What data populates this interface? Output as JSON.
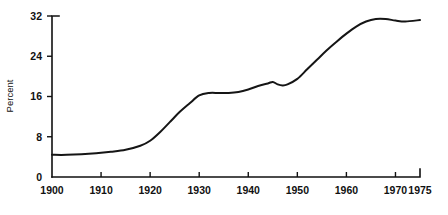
{
  "chart_data": {
    "type": "line",
    "title": "",
    "subtitle": "",
    "xlabel": "",
    "ylabel": "Percent",
    "xlim": [
      1900,
      1975
    ],
    "ylim": [
      0,
      32
    ],
    "grid": false,
    "legend": null,
    "x_ticks": [
      1900,
      1910,
      1920,
      1930,
      1940,
      1950,
      1960,
      1970,
      1975
    ],
    "x_tick_labels": [
      "1900",
      "1910",
      "1920",
      "1930",
      "1940",
      "1950",
      "1960",
      "1970",
      "1975"
    ],
    "y_ticks": [
      0,
      8,
      16,
      24,
      32
    ],
    "y_tick_labels": [
      "0",
      "8",
      "16",
      "24",
      "32"
    ],
    "series": [
      {
        "name": "Percent",
        "color": "#151515",
        "x": [
          1900,
          1903,
          1906,
          1909,
          1912,
          1915,
          1918,
          1920,
          1922,
          1924,
          1926,
          1928,
          1930,
          1932,
          1934,
          1936,
          1938,
          1940,
          1942,
          1944,
          1945,
          1946,
          1947,
          1948,
          1950,
          1952,
          1954,
          1956,
          1958,
          1960,
          1962,
          1964,
          1966,
          1968,
          1970,
          1972,
          1975
        ],
        "y": [
          4.4,
          4.4,
          4.5,
          4.7,
          5.0,
          5.4,
          6.2,
          7.2,
          8.9,
          10.9,
          12.9,
          14.6,
          16.2,
          16.7,
          16.7,
          16.7,
          16.9,
          17.4,
          18.1,
          18.6,
          18.9,
          18.4,
          18.2,
          18.4,
          19.5,
          21.4,
          23.3,
          25.2,
          26.9,
          28.5,
          29.9,
          30.9,
          31.4,
          31.4,
          31.1,
          30.9,
          31.2
        ]
      }
    ]
  },
  "axes": {
    "y_axis_title": "Percent"
  }
}
